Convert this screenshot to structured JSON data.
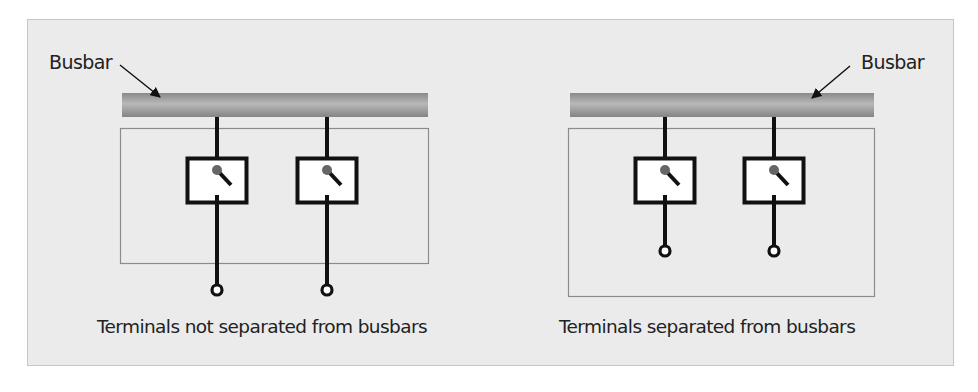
{
  "figure": {
    "panels": [
      {
        "id": "left",
        "busbar_label": "Busbar",
        "caption": "Terminals not separated from busbars",
        "switch_count": 2,
        "terminals_inside_enclosure": false
      },
      {
        "id": "right",
        "busbar_label": "Busbar",
        "caption": "Terminals separated from busbars",
        "switch_count": 2,
        "terminals_inside_enclosure": true
      }
    ],
    "colors": {
      "background": "#ebebeb",
      "frame_border": "#c6c6c6",
      "enclosure_border": "#8c8c8c",
      "busbar_top": "#8a8a8a",
      "busbar_mid": "#b8b8b8",
      "busbar_bottom": "#848484",
      "wire": "#111111",
      "switch_pivot": "#666666"
    }
  }
}
